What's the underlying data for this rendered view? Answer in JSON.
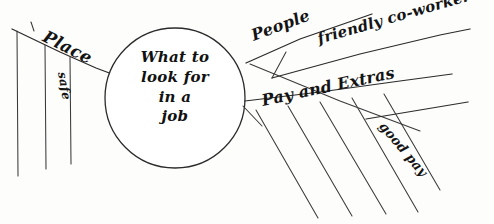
{
  "diagram": {
    "type": "hand-drawn-mind-map",
    "medium": "ink on paper",
    "central_topic": {
      "name": "central-topic",
      "lines": [
        "What to",
        "look for",
        "in a",
        "job"
      ],
      "full_text": "What to look for in a job"
    },
    "branches": [
      {
        "id": "place",
        "label": "Place",
        "direction": "left",
        "sub_branches": [
          {
            "id": "safe",
            "label": "safe"
          },
          {
            "id": "place-blank-1",
            "label": ""
          },
          {
            "id": "place-blank-2",
            "label": ""
          }
        ]
      },
      {
        "id": "people",
        "label": "People",
        "direction": "upper-right",
        "sub_branches": [
          {
            "id": "friendly-coworkers",
            "label": "friendly co-workers"
          }
        ]
      },
      {
        "id": "pay-and-extras",
        "label": "Pay and Extras",
        "direction": "lower-right",
        "sub_branches": [
          {
            "id": "good-pay",
            "label": "good pay"
          },
          {
            "id": "pay-blank-1",
            "label": ""
          },
          {
            "id": "pay-blank-2",
            "label": ""
          },
          {
            "id": "pay-blank-3",
            "label": ""
          },
          {
            "id": "pay-blank-4",
            "label": ""
          },
          {
            "id": "pay-blank-5",
            "label": ""
          }
        ]
      }
    ],
    "colors": {
      "ink": "#2b2b2b",
      "paper": "#fdfdfc",
      "text": "#141414"
    }
  }
}
